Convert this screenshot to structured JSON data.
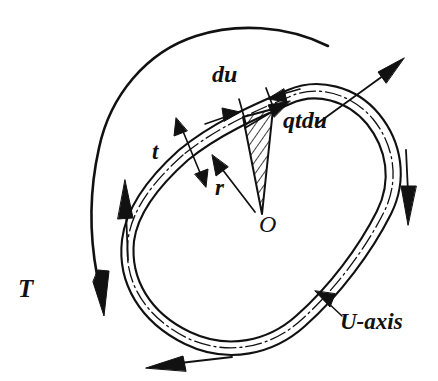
{
  "figure": {
    "background_color": "#ffffff",
    "ink_color": "#111111",
    "labels": {
      "torque": "T",
      "element_length": "du",
      "shear_force": "qtdu",
      "thickness": "t",
      "radius": "r",
      "origin": "O",
      "centerline": "U-axis"
    },
    "annotations": [
      {
        "name": "torque-arc",
        "label": "T",
        "description": "large curved arrow sweeping clockwise over the top-left, arrowhead pointing down at lower left"
      },
      {
        "name": "element-width",
        "label": "du",
        "description": "dimension between two inward-facing arrows across a short length of the tube wall"
      },
      {
        "name": "shear-force-vector",
        "label": "qtdu",
        "description": "tangential force arrow on the element along the tube centerline"
      },
      {
        "name": "wall-thickness",
        "label": "t",
        "description": "double-headed dimension arrow across the tube wall"
      },
      {
        "name": "radius-vector",
        "label": "r",
        "description": "arrow from origin O to the tube wall, perpendicular distance to the force line"
      },
      {
        "name": "origin-point",
        "label": "O",
        "description": "moment center point where the hatched wedge converges"
      },
      {
        "name": "centerline-callout",
        "label": "U-axis",
        "description": "leader line with arrowhead pointing at the dash-dot median line of the tube"
      }
    ],
    "shear_flow_arrows": [
      {
        "name": "shear-arrow-top-right",
        "direction": "up-right"
      },
      {
        "name": "shear-arrow-right",
        "direction": "down"
      },
      {
        "name": "shear-arrow-bottom",
        "direction": "left"
      },
      {
        "name": "shear-arrow-left",
        "direction": "up"
      }
    ],
    "tube": {
      "name": "closed-thin-walled-tube",
      "description": "irregular rounded closed loop drawn with outer wall, inner wall and a dash-dot median U-axis between them"
    },
    "hatched_element": {
      "name": "hatched-wedge",
      "description": "narrow triangular wedge hatched with diagonal lines, apex at O and base at the tube element of length du"
    }
  }
}
